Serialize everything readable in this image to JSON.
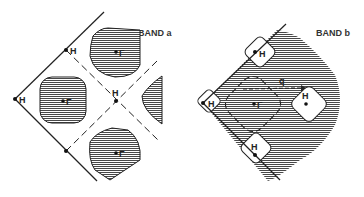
{
  "panels": [
    {
      "title": "BAND a",
      "points": {
        "H": "H",
        "Gamma": "Γ"
      }
    },
    {
      "title": "BAND b",
      "points": {
        "H": "H",
        "Gamma": "Γ",
        "q": "q"
      }
    }
  ],
  "colors": {
    "line": "#222222",
    "hatch": "#333333",
    "background": "#ffffff"
  }
}
